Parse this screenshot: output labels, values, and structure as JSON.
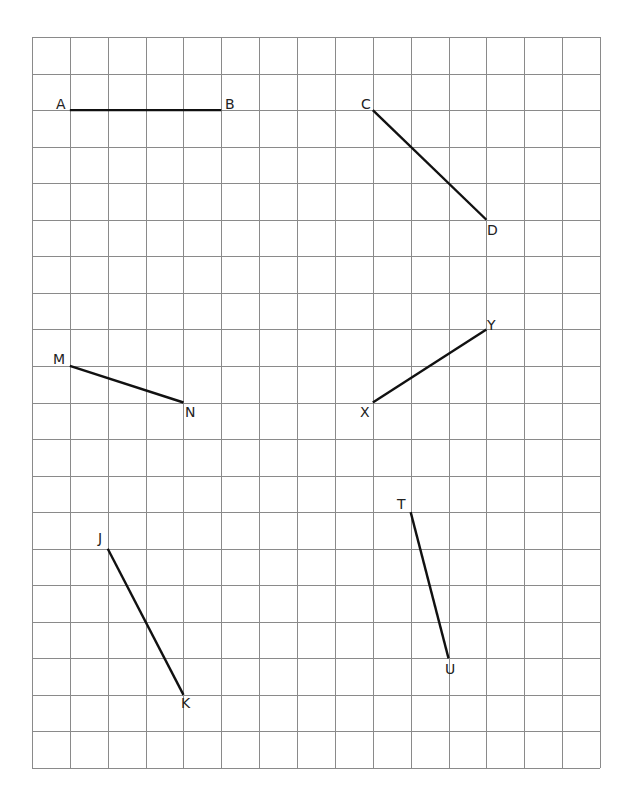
{
  "grid": {
    "left": 32,
    "top": 37,
    "right": 600,
    "bottom": 768,
    "columns": 15,
    "rows": 20,
    "line_color": "#8a8a8a",
    "segment_color": "#111111"
  },
  "segments": [
    {
      "name": "AB",
      "p1": {
        "label": "A",
        "col": 1,
        "row": 2
      },
      "p2": {
        "label": "B",
        "col": 5,
        "row": 2
      }
    },
    {
      "name": "CD",
      "p1": {
        "label": "C",
        "col": 9,
        "row": 2
      },
      "p2": {
        "label": "D",
        "col": 12,
        "row": 5
      }
    },
    {
      "name": "MN",
      "p1": {
        "label": "M",
        "col": 1,
        "row": 9
      },
      "p2": {
        "label": "N",
        "col": 4,
        "row": 10
      }
    },
    {
      "name": "XY",
      "p1": {
        "label": "X",
        "col": 9,
        "row": 10
      },
      "p2": {
        "label": "Y",
        "col": 12,
        "row": 8
      }
    },
    {
      "name": "JK",
      "p1": {
        "label": "J",
        "col": 2,
        "row": 14
      },
      "p2": {
        "label": "K",
        "col": 4,
        "row": 18
      }
    },
    {
      "name": "TU",
      "p1": {
        "label": "T",
        "col": 10,
        "row": 13
      },
      "p2": {
        "label": "U",
        "col": 11,
        "row": 17
      }
    }
  ],
  "labels": {
    "A": {
      "text": "A",
      "x": 56,
      "y": 97
    },
    "B": {
      "text": "B",
      "x": 225,
      "y": 97
    },
    "C": {
      "text": "C",
      "x": 361,
      "y": 97
    },
    "D": {
      "text": "D",
      "x": 487,
      "y": 223
    },
    "M": {
      "text": "M",
      "x": 53,
      "y": 352
    },
    "N": {
      "text": "N",
      "x": 185,
      "y": 405
    },
    "X": {
      "text": "X",
      "x": 360,
      "y": 405
    },
    "Y": {
      "text": "Y",
      "x": 487,
      "y": 318
    },
    "J": {
      "text": "J",
      "x": 98,
      "y": 531
    },
    "K": {
      "text": "K",
      "x": 181,
      "y": 696
    },
    "T": {
      "text": "T",
      "x": 397,
      "y": 497
    },
    "U": {
      "text": "U",
      "x": 445,
      "y": 662
    }
  }
}
